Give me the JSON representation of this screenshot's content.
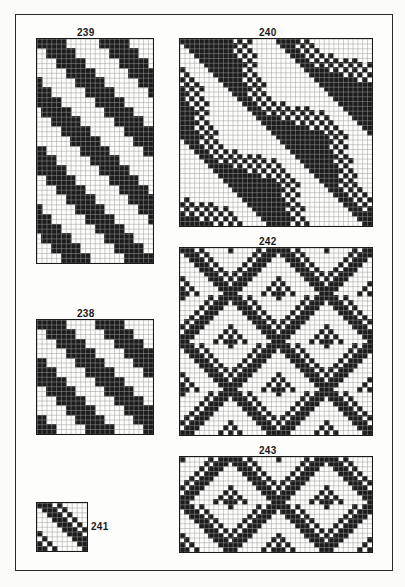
{
  "page": {
    "frame_color": "#2a2a2a",
    "ink_color": "#1c1c1c",
    "paper_color": "#fdfdfb",
    "grid_color": "#9a9a9a"
  },
  "figures": [
    {
      "id": "fig-239",
      "label": "239",
      "x": 36,
      "y": 38,
      "w": 116,
      "h": 224,
      "cols": 24,
      "rows": 46,
      "label_x": 86,
      "label_y": 27,
      "pattern": "twill-diagonal",
      "repeat": 13,
      "floats": [
        6,
        1,
        1,
        1,
        4
      ]
    },
    {
      "id": "fig-240",
      "label": "240",
      "x": 179,
      "y": 38,
      "w": 192,
      "h": 187,
      "cols": 40,
      "rows": 39,
      "label_x": 268,
      "label_y": 27,
      "pattern": "undulating-twill",
      "repeat": 20,
      "floats": [
        1,
        1,
        1,
        1,
        1,
        1
      ]
    },
    {
      "id": "fig-238",
      "label": "238",
      "x": 36,
      "y": 319,
      "w": 116,
      "h": 114,
      "cols": 24,
      "rows": 24,
      "label_x": 86,
      "label_y": 308,
      "pattern": "twill-diagonal",
      "repeat": 12,
      "floats": [
        5,
        1,
        1,
        1,
        4
      ]
    },
    {
      "id": "fig-242",
      "label": "242",
      "x": 179,
      "y": 247,
      "w": 192,
      "h": 187,
      "cols": 40,
      "rows": 39,
      "label_x": 268,
      "label_y": 236,
      "pattern": "broken-twill",
      "repeat": 10,
      "floats": [
        3,
        1,
        1,
        1,
        1
      ]
    },
    {
      "id": "fig-241",
      "label": "241",
      "x": 36,
      "y": 502,
      "w": 50,
      "h": 48,
      "cols": 10,
      "rows": 10,
      "label_x": 91,
      "label_y": 521,
      "pattern": "small-twill",
      "repeat": 10,
      "floats": [
        3,
        1,
        1,
        1
      ]
    },
    {
      "id": "fig-243",
      "label": "243",
      "x": 179,
      "y": 456,
      "w": 192,
      "h": 95,
      "cols": 40,
      "rows": 20,
      "label_x": 268,
      "label_y": 445,
      "pattern": "broken-twill-b",
      "repeat": 10,
      "floats": [
        3,
        1,
        1,
        1,
        1
      ]
    }
  ]
}
